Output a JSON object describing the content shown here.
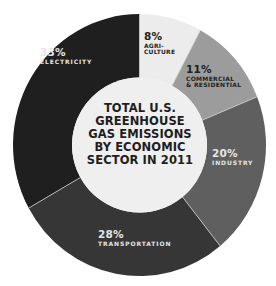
{
  "chart_data": {
    "type": "pie",
    "variant": "donut",
    "title": "TOTAL U.S. GREENHOUSE GAS EMISSIONS BY ECONOMIC SECTOR IN 2011",
    "title_lines": [
      "TOTAL U.S.",
      "GREENHOUSE",
      "GAS EMISSIONS",
      "BY ECONOMIC",
      "SECTOR IN 2011"
    ],
    "unit": "%",
    "start_angle_deg": 0,
    "direction": "clockwise",
    "slices": [
      {
        "label": "AGRI-\nCULTURE",
        "label_lines": [
          "AGRI-",
          "CULTURE"
        ],
        "name": "Agriculture",
        "value": 8,
        "value_label": "8%",
        "color": "#ececec"
      },
      {
        "label": "COMMERCIAL\n& RESIDENTIAL",
        "label_lines": [
          "COMMERCIAL",
          "& RESIDENTIAL"
        ],
        "name": "Commercial & Residential",
        "value": 11,
        "value_label": "11%",
        "color": "#9c9c9c"
      },
      {
        "label": "INDUSTRY",
        "label_lines": [
          "INDUSTRY"
        ],
        "name": "Industry",
        "value": 20,
        "value_label": "20%",
        "color": "#5f5f5f"
      },
      {
        "label": "TRANSPORTATION",
        "label_lines": [
          "TRANSPORTATION"
        ],
        "name": "Transportation",
        "value": 28,
        "value_label": "28%",
        "color": "#363636"
      },
      {
        "label": "ELECTRICITY",
        "label_lines": [
          "ELECTRICITY"
        ],
        "name": "Electricity",
        "value": 33,
        "value_label": "33%",
        "color": "#1f1f1f"
      }
    ],
    "center_color": "#efefef",
    "legend": "none (labels inside slices)"
  }
}
